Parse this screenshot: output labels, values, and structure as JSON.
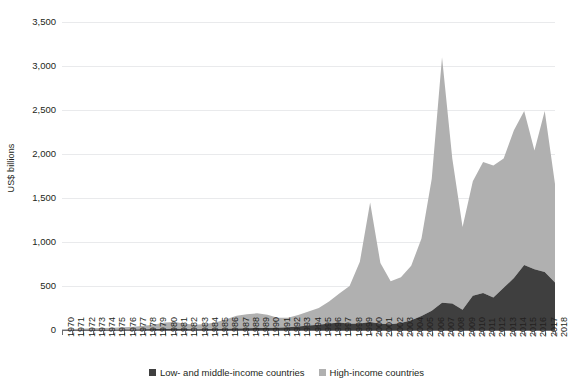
{
  "chart_data": {
    "type": "area",
    "stacked": true,
    "title": "",
    "subtitle": "",
    "xlabel": "",
    "ylabel": "US$ billions",
    "ylim": [
      0,
      3500
    ],
    "ytick_step": 500,
    "ytick_labels": [
      "3,500",
      "3,000",
      "2,500",
      "2,000",
      "1,500",
      "1,000",
      "500",
      "0"
    ],
    "ytick_values": [
      3500,
      3000,
      2500,
      2000,
      1500,
      1000,
      500,
      0
    ],
    "grid": "horizontal",
    "legend_position": "bottom",
    "colors": {
      "low_middle_income": "#3f3f3f",
      "high_income": "#b0b0b0",
      "gridline": "#e9eaec",
      "axis": "#6d6e71",
      "text": "#231f20"
    },
    "categories": [
      "1970",
      "1971",
      "1972",
      "1973",
      "1974",
      "1975",
      "1976",
      "1977",
      "1978",
      "1979",
      "1980",
      "1981",
      "1982",
      "1983",
      "1984",
      "1985",
      "1986",
      "1987",
      "1988",
      "1989",
      "1990",
      "1991",
      "1992",
      "1993",
      "1994",
      "1995",
      "1996",
      "1997",
      "1998",
      "1999",
      "2000",
      "2001",
      "2002",
      "2003",
      "2004",
      "2005",
      "2006",
      "2007",
      "2008",
      "2009",
      "2010",
      "2011",
      "2012",
      "2013",
      "2014",
      "2015",
      "2016",
      "2017",
      "2018"
    ],
    "series": [
      {
        "name": "Low- and middle-income countries",
        "color": "#3f3f3f",
        "values": [
          1,
          1,
          2,
          3,
          4,
          4,
          5,
          6,
          8,
          10,
          12,
          13,
          11,
          9,
          10,
          12,
          13,
          16,
          20,
          24,
          22,
          25,
          30,
          40,
          50,
          60,
          75,
          85,
          70,
          75,
          90,
          70,
          65,
          80,
          110,
          160,
          220,
          310,
          300,
          230,
          390,
          420,
          370,
          480,
          590,
          740,
          690,
          660,
          540
        ]
      },
      {
        "name": "High-income countries",
        "color": "#b0b0b0",
        "values": [
          8,
          10,
          13,
          17,
          20,
          22,
          26,
          30,
          40,
          52,
          72,
          78,
          60,
          52,
          58,
          75,
          110,
          145,
          160,
          165,
          150,
          115,
          110,
          130,
          160,
          190,
          250,
          330,
          430,
          700,
          1360,
          690,
          490,
          520,
          620,
          880,
          1500,
          2790,
          1650,
          940,
          1300,
          1490,
          1500,
          1470,
          1680,
          1750,
          1350,
          1830,
          1120
        ]
      }
    ],
    "totals": [
      9,
      11,
      15,
      20,
      24,
      26,
      31,
      36,
      48,
      62,
      84,
      91,
      71,
      61,
      68,
      87,
      123,
      161,
      180,
      189,
      172,
      140,
      140,
      170,
      210,
      250,
      325,
      415,
      500,
      775,
      1450,
      760,
      555,
      600,
      730,
      1040,
      1720,
      3100,
      1950,
      1170,
      1690,
      1910,
      1870,
      1950,
      2270,
      2490,
      2040,
      2490,
      1660
    ],
    "annotations": []
  },
  "legend": {
    "items": [
      {
        "label": "Low- and middle-income countries",
        "color": "#3f3f3f"
      },
      {
        "label": "High-income countries",
        "color": "#b0b0b0"
      }
    ]
  }
}
